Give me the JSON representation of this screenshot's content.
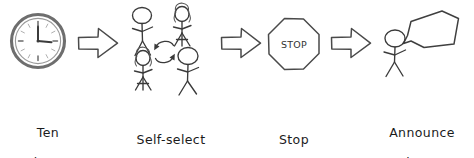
{
  "diagram": {
    "type": "process-flow",
    "orientation": "horizontal",
    "background_color": "#ffffff",
    "ink_color": "#3a3a3a",
    "text_color": "#1b1b1b",
    "style": "hand-drawn sketch",
    "step_count": 4,
    "connector_count": 3,
    "steps": [
      {
        "index": 1,
        "icon": "wall-clock-icon",
        "icon_description": "round analog clock showing hands at roughly three o'clock",
        "label_line1": "Ten",
        "label_line2": "minutes",
        "label_full": "Ten minutes"
      },
      {
        "index": 2,
        "icon": "four-people-rotation-icon",
        "icon_description": "four stick figures arranged in a square around two circular rotation arrows",
        "label_line1": "Self-select",
        "label_line2": "",
        "label_full": "Self-select"
      },
      {
        "index": 3,
        "icon": "stop-sign-icon",
        "icon_description": "octagonal stop sign outline",
        "sign_text": "STOP",
        "label_line1": "Stop",
        "label_line2": "",
        "label_full": "Stop"
      },
      {
        "index": 4,
        "icon": "person-speech-bubble-icon",
        "icon_description": "stick figure with a blank speech bubble",
        "label_line1": "Announce",
        "label_line2": "to the room",
        "label_full": "Announce to the room"
      }
    ],
    "connectors": [
      {
        "index": 1,
        "icon": "right-arrow-icon",
        "direction": "right"
      },
      {
        "index": 2,
        "icon": "right-arrow-icon",
        "direction": "right"
      },
      {
        "index": 3,
        "icon": "right-arrow-icon",
        "direction": "right"
      }
    ]
  }
}
